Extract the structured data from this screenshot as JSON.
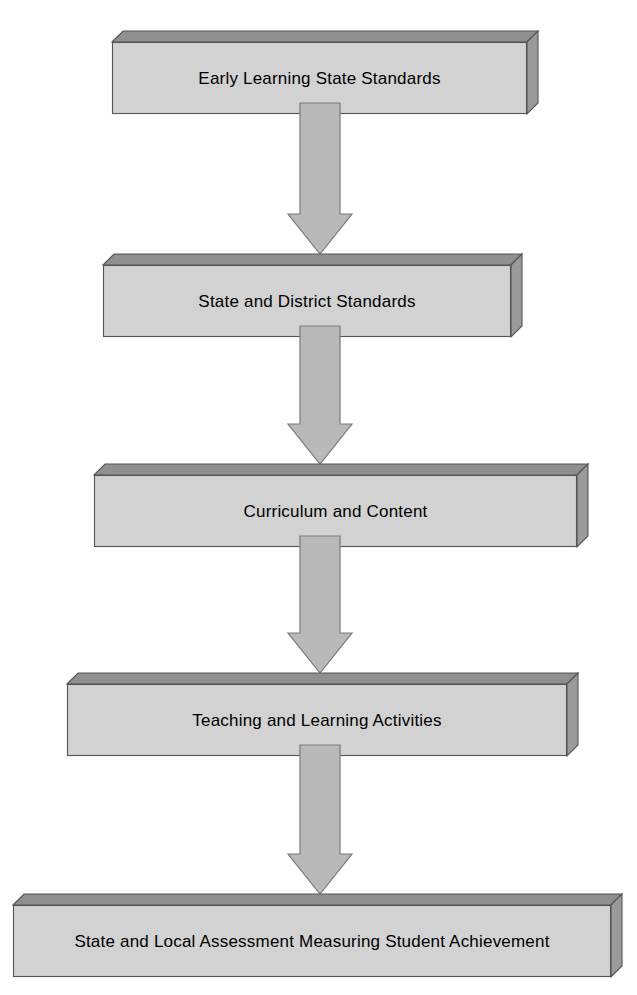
{
  "diagram": {
    "type": "flowchart",
    "orientation": "vertical-top-down",
    "title": "",
    "background_color": "#ffffff",
    "node_face_color": "#d2d2d2",
    "node_top_bevel_color": "#8f8f8f",
    "node_side_bevel_color": "#9a9a9a",
    "node_outline_color": "#555555",
    "arrow_fill_color": "#b9b9b9",
    "arrow_outline_color": "#7a7a7a",
    "text_color": "#000000",
    "nodes": [
      {
        "id": "node-1",
        "label": "Early Learning State Standards",
        "order": 1,
        "x": 112,
        "y": 31,
        "width": 415,
        "height": 72,
        "depth": 11
      },
      {
        "id": "node-2",
        "label": "State and District Standards",
        "order": 2,
        "x": 103,
        "y": 254,
        "width": 408,
        "height": 72,
        "depth": 11
      },
      {
        "id": "node-3",
        "label": "Curriculum and Content",
        "order": 3,
        "x": 94,
        "y": 464,
        "width": 483,
        "height": 72,
        "depth": 11
      },
      {
        "id": "node-4",
        "label": "Teaching and Learning Activities",
        "order": 4,
        "x": 67,
        "y": 673,
        "width": 500,
        "height": 72,
        "depth": 11
      },
      {
        "id": "node-5",
        "label": "State and Local Assessment Measuring Student Achievement",
        "order": 5,
        "x": 13,
        "y": 894,
        "width": 598,
        "height": 72,
        "depth": 11
      }
    ],
    "connectors": [
      {
        "id": "arrow-1",
        "from": "node-1",
        "to": "node-2",
        "direction": "down",
        "x": 288,
        "y": 103,
        "shaft_width": 40,
        "head_width": 64,
        "total_height": 151,
        "head_height": 40
      },
      {
        "id": "arrow-2",
        "from": "node-2",
        "to": "node-3",
        "direction": "down",
        "x": 288,
        "y": 326,
        "shaft_width": 40,
        "head_width": 64,
        "total_height": 138,
        "head_height": 40
      },
      {
        "id": "arrow-3",
        "from": "node-3",
        "to": "node-4",
        "direction": "down",
        "x": 288,
        "y": 536,
        "shaft_width": 40,
        "head_width": 64,
        "total_height": 137,
        "head_height": 40
      },
      {
        "id": "arrow-4",
        "from": "node-4",
        "to": "node-5",
        "direction": "down",
        "x": 288,
        "y": 745,
        "shaft_width": 40,
        "head_width": 64,
        "total_height": 149,
        "head_height": 40
      }
    ]
  }
}
